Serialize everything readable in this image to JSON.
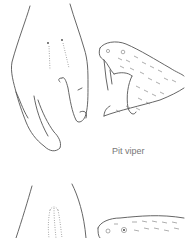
{
  "figure": {
    "caption_top": "Pit viper",
    "illustrations": [
      {
        "name": "hand-with-fang-marks",
        "description": "hand showing two puncture wounds"
      },
      {
        "name": "pit-viper-head",
        "description": "snake head with open mouth and fangs"
      },
      {
        "name": "hand-with-bite-marks",
        "description": "second hand showing row of teeth marks"
      },
      {
        "name": "nonvenomous-snake-head",
        "description": "second snake head, partially visible"
      }
    ]
  }
}
